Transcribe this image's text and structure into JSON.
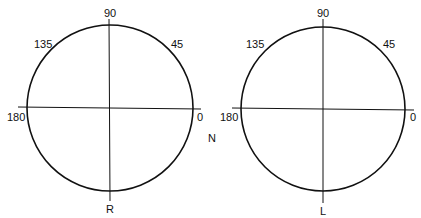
{
  "diagram": {
    "panels": [
      {
        "id": "right",
        "bottom_label": "R",
        "angle_labels": {
          "top": "90",
          "upper_right": "45",
          "upper_left": "135",
          "left": "180",
          "right": "0"
        }
      },
      {
        "id": "left",
        "bottom_label": "L",
        "angle_labels": {
          "top": "90",
          "upper_right": "45",
          "upper_left": "135",
          "left": "180",
          "right": "0"
        }
      }
    ],
    "center_label": "N",
    "line_color": "#111111"
  }
}
